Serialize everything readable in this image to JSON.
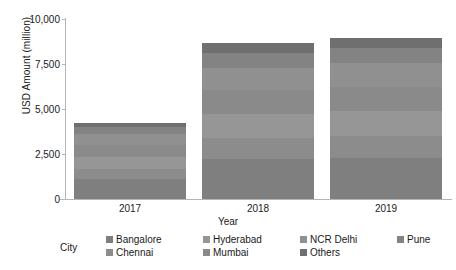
{
  "chart_data": {
    "type": "bar",
    "subtype": "stacked-vertical",
    "title": "",
    "xlabel": "Year",
    "ylabel": "USD Amount (million)",
    "categories": [
      "2017",
      "2018",
      "2019"
    ],
    "ylim": [
      0,
      10000
    ],
    "yticks": [
      "0",
      "2,500",
      "5,000",
      "7,500",
      "10,000"
    ],
    "ytick_values": [
      0,
      2500,
      5000,
      7500,
      10000
    ],
    "grid": false,
    "legend_title": "City",
    "legend_position": "bottom",
    "series": [
      {
        "name": "Bangalore",
        "color": "#7f7f7f",
        "values": [
          1100,
          2250,
          2300
        ]
      },
      {
        "name": "Chennai",
        "color": "#8c8c8c",
        "values": [
          550,
          1150,
          1200
        ]
      },
      {
        "name": "Hyderabad",
        "color": "#969696",
        "values": [
          700,
          1350,
          1400
        ]
      },
      {
        "name": "Mumbai",
        "color": "#8a8a8a",
        "values": [
          650,
          1300,
          1350
        ]
      },
      {
        "name": "NCR Delhi",
        "color": "#909090",
        "values": [
          600,
          1250,
          1300
        ]
      },
      {
        "name": "Pune",
        "color": "#838383",
        "values": [
          400,
          800,
          850
        ]
      },
      {
        "name": "Others",
        "color": "#6f6f6f",
        "values": [
          200,
          550,
          550
        ]
      }
    ],
    "totals": [
      4200,
      8650,
      8950
    ],
    "legend_entries": [
      "Bangalore",
      "Hyderabad",
      "NCR Delhi",
      "Pune",
      "Chennai",
      "Mumbai",
      "Others"
    ],
    "colors": {
      "axis": "#b5b5b5",
      "text": "#1a1a1a",
      "background": "#ffffff"
    }
  }
}
